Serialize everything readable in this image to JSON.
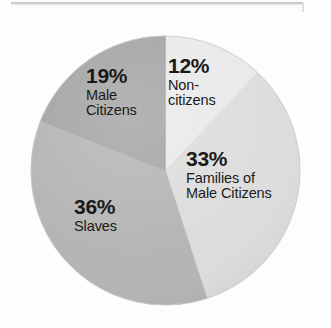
{
  "figure": {
    "background_color": "#fdfdfd",
    "scan_edge_color": "#c4c4c4"
  },
  "chart_data": {
    "type": "pie",
    "title": "",
    "subtitle": "",
    "xlabel": "",
    "ylabel": "",
    "legend_position": "none",
    "labels_placement": "inside-slice",
    "start_angle_deg": 0,
    "direction": "clockwise",
    "categories": [
      "Non-citizens",
      "Families of Male Citizens",
      "Slaves",
      "Male Citizens"
    ],
    "values": [
      12,
      33,
      36,
      19
    ],
    "units": "percent",
    "total": 100,
    "slices": [
      {
        "label": "Non-citizens",
        "label_line1": "Non-",
        "label_line2": "citizens",
        "percent_text": "12%",
        "value": 12,
        "color": "#e9e9e9",
        "start_angle_deg": 0,
        "end_angle_deg": 43.2
      },
      {
        "label": "Families of Male Citizens",
        "label_line1": "Families of",
        "label_line2": "Male Citizens",
        "percent_text": "33%",
        "value": 33,
        "color": "#dcdcdc",
        "start_angle_deg": 43.2,
        "end_angle_deg": 162.0
      },
      {
        "label": "Slaves",
        "label_line1": "Slaves",
        "label_line2": "",
        "percent_text": "36%",
        "value": 36,
        "color": "#b3b3b3",
        "start_angle_deg": 162.0,
        "end_angle_deg": 291.6
      },
      {
        "label": "Male Citizens",
        "label_line1": "Male",
        "label_line2": "Citizens",
        "percent_text": "19%",
        "value": 19,
        "color": "#a2a2a2",
        "start_angle_deg": 291.6,
        "end_angle_deg": 360.0
      }
    ]
  }
}
